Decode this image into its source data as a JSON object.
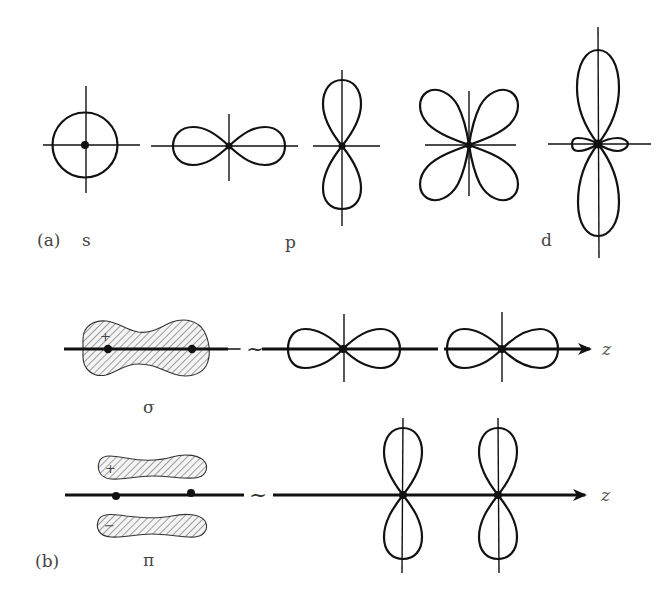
{
  "figure": {
    "part_a": {
      "label": "(a)",
      "orbitals": [
        {
          "type": "s",
          "label": "s"
        },
        {
          "type": "p",
          "label": "p"
        },
        {
          "type": "d",
          "label": "d"
        }
      ]
    },
    "part_b": {
      "label": "(b)",
      "bonds": [
        {
          "type": "sigma",
          "label": "σ",
          "signs": [
            "+"
          ],
          "axis_label": "z",
          "equivalence": "~"
        },
        {
          "type": "pi",
          "label": "π",
          "signs": [
            "+",
            "−"
          ],
          "axis_label": "z",
          "equivalence": "~"
        }
      ]
    }
  },
  "colors": {
    "ink": "#111111",
    "label": "#444444",
    "background": "#ffffff"
  }
}
